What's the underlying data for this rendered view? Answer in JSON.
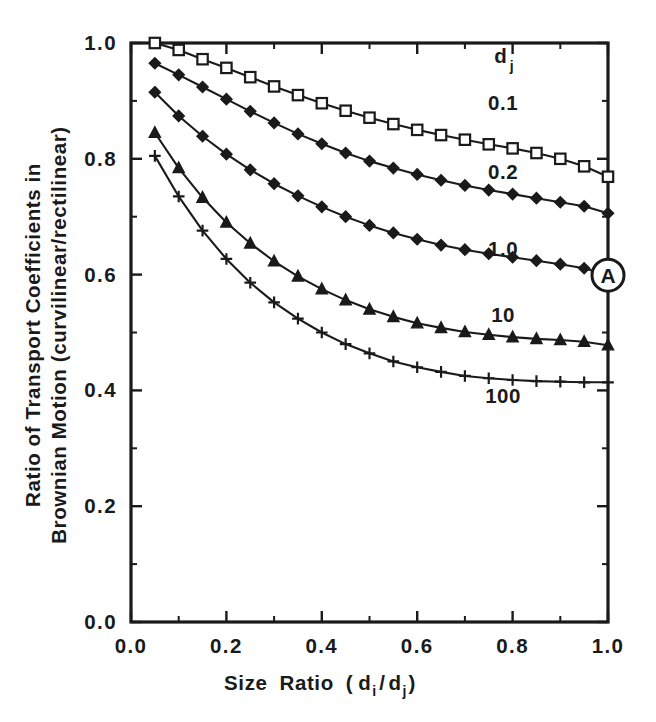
{
  "chart_data": {
    "type": "line",
    "title": "",
    "xlabel": "Size Ratio ( d i / d j )",
    "xlabel_parts": {
      "main_a": "Size",
      "main_b": "Ratio",
      "paren_open": "(",
      "d1": "d",
      "sub1": "i",
      "slash": "/",
      "d2": "d",
      "sub2": "j",
      "paren_close": ")"
    },
    "ylabel_line1": "Ratio of Transport Coefficients in",
    "ylabel_line2": "Brownian Motion  (curvilinear/rectilinear)",
    "xlim": [
      0.0,
      1.0
    ],
    "ylim": [
      0.0,
      1.0
    ],
    "x_ticks": [
      "0.0",
      "0.2",
      "0.4",
      "0.6",
      "0.8",
      "1.0"
    ],
    "x_tick_values": [
      0.0,
      0.2,
      0.4,
      0.6,
      0.8,
      1.0
    ],
    "x_minor_values": [
      0.1,
      0.3,
      0.5,
      0.7,
      0.9
    ],
    "y_ticks": [
      "0.0",
      "0.2",
      "0.4",
      "0.6",
      "0.8",
      "1.0"
    ],
    "y_tick_values": [
      0.0,
      0.2,
      0.4,
      0.6,
      0.8,
      1.0
    ],
    "y_minor_values": [
      0.1,
      0.3,
      0.5,
      0.7,
      0.9
    ],
    "grid": false,
    "legend_position": "inline-right",
    "legend_title": "d",
    "legend_title_sub": "j",
    "x": [
      0.05,
      0.1,
      0.15,
      0.2,
      0.25,
      0.3,
      0.35,
      0.4,
      0.45,
      0.5,
      0.55,
      0.6,
      0.65,
      0.7,
      0.75,
      0.8,
      0.85,
      0.9,
      0.95,
      1.0
    ],
    "series": [
      {
        "name": "0.1",
        "marker": "open-square",
        "label_x": 0.78,
        "label_y": 0.885,
        "values": [
          1.0,
          0.988,
          0.972,
          0.957,
          0.941,
          0.925,
          0.91,
          0.896,
          0.883,
          0.871,
          0.86,
          0.85,
          0.841,
          0.833,
          0.825,
          0.818,
          0.81,
          0.8,
          0.787,
          0.769
        ]
      },
      {
        "name": "0.2",
        "marker": "filled-diamond",
        "label_x": 0.78,
        "label_y": 0.765,
        "values": [
          0.965,
          0.945,
          0.924,
          0.903,
          0.882,
          0.862,
          0.843,
          0.826,
          0.81,
          0.796,
          0.784,
          0.773,
          0.763,
          0.754,
          0.746,
          0.739,
          0.732,
          0.725,
          0.718,
          0.706
        ]
      },
      {
        "name": "1.0",
        "marker": "filled-diamond",
        "label_x": 0.78,
        "label_y": 0.632,
        "values": [
          0.915,
          0.874,
          0.839,
          0.808,
          0.781,
          0.757,
          0.736,
          0.717,
          0.7,
          0.685,
          0.672,
          0.661,
          0.651,
          0.643,
          0.636,
          0.63,
          0.624,
          0.618,
          0.611,
          0.599
        ]
      },
      {
        "name": "10",
        "marker": "filled-triangle",
        "label_x": 0.78,
        "label_y": 0.518,
        "values": [
          0.845,
          0.784,
          0.733,
          0.69,
          0.654,
          0.623,
          0.597,
          0.575,
          0.556,
          0.54,
          0.527,
          0.516,
          0.508,
          0.501,
          0.496,
          0.492,
          0.489,
          0.487,
          0.484,
          0.478
        ]
      },
      {
        "name": "100",
        "marker": "plus",
        "label_x": 0.78,
        "label_y": 0.378,
        "values": [
          0.805,
          0.735,
          0.676,
          0.627,
          0.586,
          0.552,
          0.524,
          0.5,
          0.48,
          0.464,
          0.45,
          0.44,
          0.432,
          0.425,
          0.421,
          0.418,
          0.416,
          0.415,
          0.414,
          0.414
        ]
      }
    ],
    "annotations": [
      {
        "text": "A",
        "shape": "circle",
        "x": 1.0,
        "y": 0.599
      }
    ]
  },
  "colors": {
    "ink": "#1a1a1a",
    "paper": "#ffffff"
  }
}
